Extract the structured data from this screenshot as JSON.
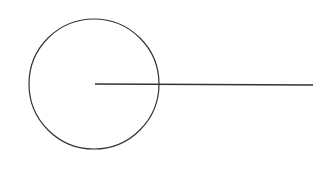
{
  "diagram": {
    "background": "#ffffff",
    "stroke_color": "#333333",
    "circle": {
      "cx": 94,
      "cy": 84,
      "r": 65
    },
    "radius_line": {
      "x1": 95,
      "y1": 84,
      "x2": 313,
      "y2": 85
    }
  }
}
